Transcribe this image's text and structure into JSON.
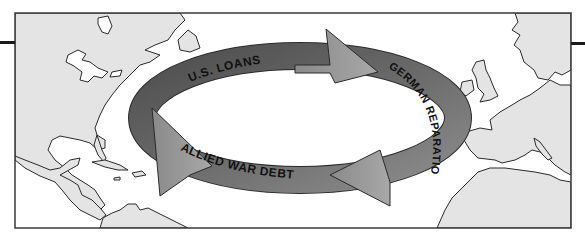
{
  "diagram": {
    "type": "cycle-map",
    "description_visible": "Circular flow of money across the Atlantic",
    "colors": {
      "land": "#e4e4e4",
      "water": "#ffffff",
      "coastline": "#2a2a2a",
      "ring_dark": "#5a5a5a",
      "ring_light": "#8a8a8a",
      "arrowhead": "#9a9a9a",
      "label": "#111111",
      "frame": "#3a3a3a"
    },
    "flows": [
      {
        "id": "us-loans",
        "label": "U.S. LOANS",
        "from": "United States",
        "to": "Germany"
      },
      {
        "id": "german-reparations",
        "label": "GERMAN REPARATIONS",
        "from": "Germany",
        "to": "Allies"
      },
      {
        "id": "allied-war-debt",
        "label": "ALLIED WAR DEBT",
        "from": "Allies",
        "to": "United States"
      }
    ]
  }
}
